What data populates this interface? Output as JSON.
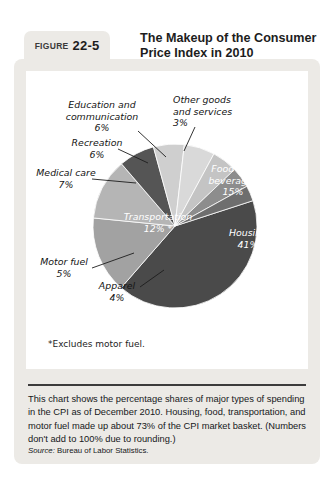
{
  "figure": {
    "label": "FIGURE",
    "number": "22-5",
    "title": "The Makeup of the Consumer Price Index in 2010"
  },
  "chart_data": {
    "type": "pie",
    "title": "The Makeup of the Consumer Price Index in 2010",
    "unit": "percent",
    "legend": "none",
    "categories": [
      "Housing",
      "Food and beverages",
      "Transportation",
      "Medical care",
      "Education and communication",
      "Recreation",
      "Motor fuel",
      "Apparel",
      "Other goods and services"
    ],
    "values": [
      41,
      15,
      12,
      7,
      6,
      6,
      5,
      4,
      3
    ],
    "labels": [
      {
        "name": "Housing",
        "value": "41%",
        "text": "Housing\n41%",
        "placement": "inside"
      },
      {
        "name": "Food and beverages",
        "value": "15%",
        "text": "Food and\nbeverages\n15%",
        "placement": "inside"
      },
      {
        "name": "Transportation",
        "value": "12%*",
        "text": "Transportation\n12% *",
        "placement": "inside"
      },
      {
        "name": "Medical care",
        "value": "7%",
        "text": "Medical care\n7%",
        "placement": "outside"
      },
      {
        "name": "Education and communication",
        "value": "6%",
        "text": "Education and\ncommunication\n6%",
        "placement": "outside"
      },
      {
        "name": "Recreation",
        "value": "6%",
        "text": "Recreation\n6%",
        "placement": "outside"
      },
      {
        "name": "Motor fuel",
        "value": "5%",
        "text": "Motor fuel\n5%",
        "placement": "outside"
      },
      {
        "name": "Apparel",
        "value": "4%",
        "text": "Apparel\n4%",
        "placement": "outside"
      },
      {
        "name": "Other goods and services",
        "value": "3%",
        "text": "Other goods\nand services\n3%",
        "placement": "outside"
      }
    ],
    "colors": [
      "#4a4a4a",
      "#a2a2a2",
      "#b5b5b5",
      "#555555",
      "#cfcfcf",
      "#d9d9d9",
      "#c4c4c4",
      "#8d8d8d",
      "#6e6e6e"
    ],
    "footnote": "*Excludes motor fuel."
  },
  "caption": {
    "text": "This chart shows the percentage shares of major types of spending in the CPI as of December 2010. Housing, food, transportation, and motor fuel made up about 73% of the CPI market basket. (Numbers don't add to 100% due to rounding.)",
    "source_label": "Source:",
    "source_text": "Bureau of Labor Statistics."
  }
}
